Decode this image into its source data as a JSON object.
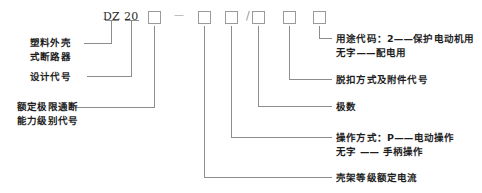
{
  "diagram": {
    "type": "model-designation-breakdown",
    "line_color": "#8d8d8d",
    "text_color": "#1e1e1e"
  },
  "code_string": {
    "tokens": [
      {
        "key": "prefix",
        "text": "DZ",
        "kind": "text"
      },
      {
        "key": "design",
        "text": "20",
        "kind": "text"
      },
      {
        "key": "slot1",
        "text": "",
        "kind": "box"
      },
      {
        "key": "dash",
        "text": "—",
        "kind": "text"
      },
      {
        "key": "slot2",
        "text": "",
        "kind": "box"
      },
      {
        "key": "slot3",
        "text": "",
        "kind": "box"
      },
      {
        "key": "slash",
        "text": "/",
        "kind": "text"
      },
      {
        "key": "slot4",
        "text": "",
        "kind": "box"
      },
      {
        "key": "slot5",
        "text": "",
        "kind": "box"
      },
      {
        "key": "slot6",
        "text": "",
        "kind": "box"
      }
    ]
  },
  "labels_left": [
    {
      "name": "plastic-case-breaker",
      "line1": "塑料外壳",
      "line2": "式断路器"
    },
    {
      "name": "design-code",
      "line1": "设计代号",
      "line2": ""
    },
    {
      "name": "rated-breaking-capacity-class-code",
      "line1": "额定极限通断",
      "line2": "能力级别代号"
    }
  ],
  "labels_right": [
    {
      "name": "usage-code",
      "line1": "用途代码：2——保护电动机用",
      "line2": "无字——配电用"
    },
    {
      "name": "trip-mode-and-accessory-code",
      "line1": "脱扣方式及附件代号",
      "line2": ""
    },
    {
      "name": "pole-count",
      "line1": "极数",
      "line2": ""
    },
    {
      "name": "operation-mode",
      "line1": "操作方式：P——电动操作",
      "line2": "无字 —— 手柄操作"
    },
    {
      "name": "frame-rated-current",
      "line1": "壳架等级额定电流",
      "line2": ""
    }
  ]
}
